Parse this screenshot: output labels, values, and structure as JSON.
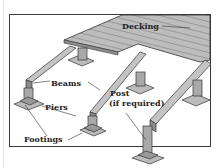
{
  "diagram": {
    "labels": {
      "decking": "Decking",
      "beams": "Beams",
      "piers": "Piers",
      "post_line1": "Post",
      "post_line2": "(if required)",
      "footings": "Footings"
    },
    "colors": {
      "wood": "#b8b8b8",
      "wood_dark": "#8a8a8a",
      "line": "#333333",
      "frame": "#3a3a3a"
    }
  }
}
